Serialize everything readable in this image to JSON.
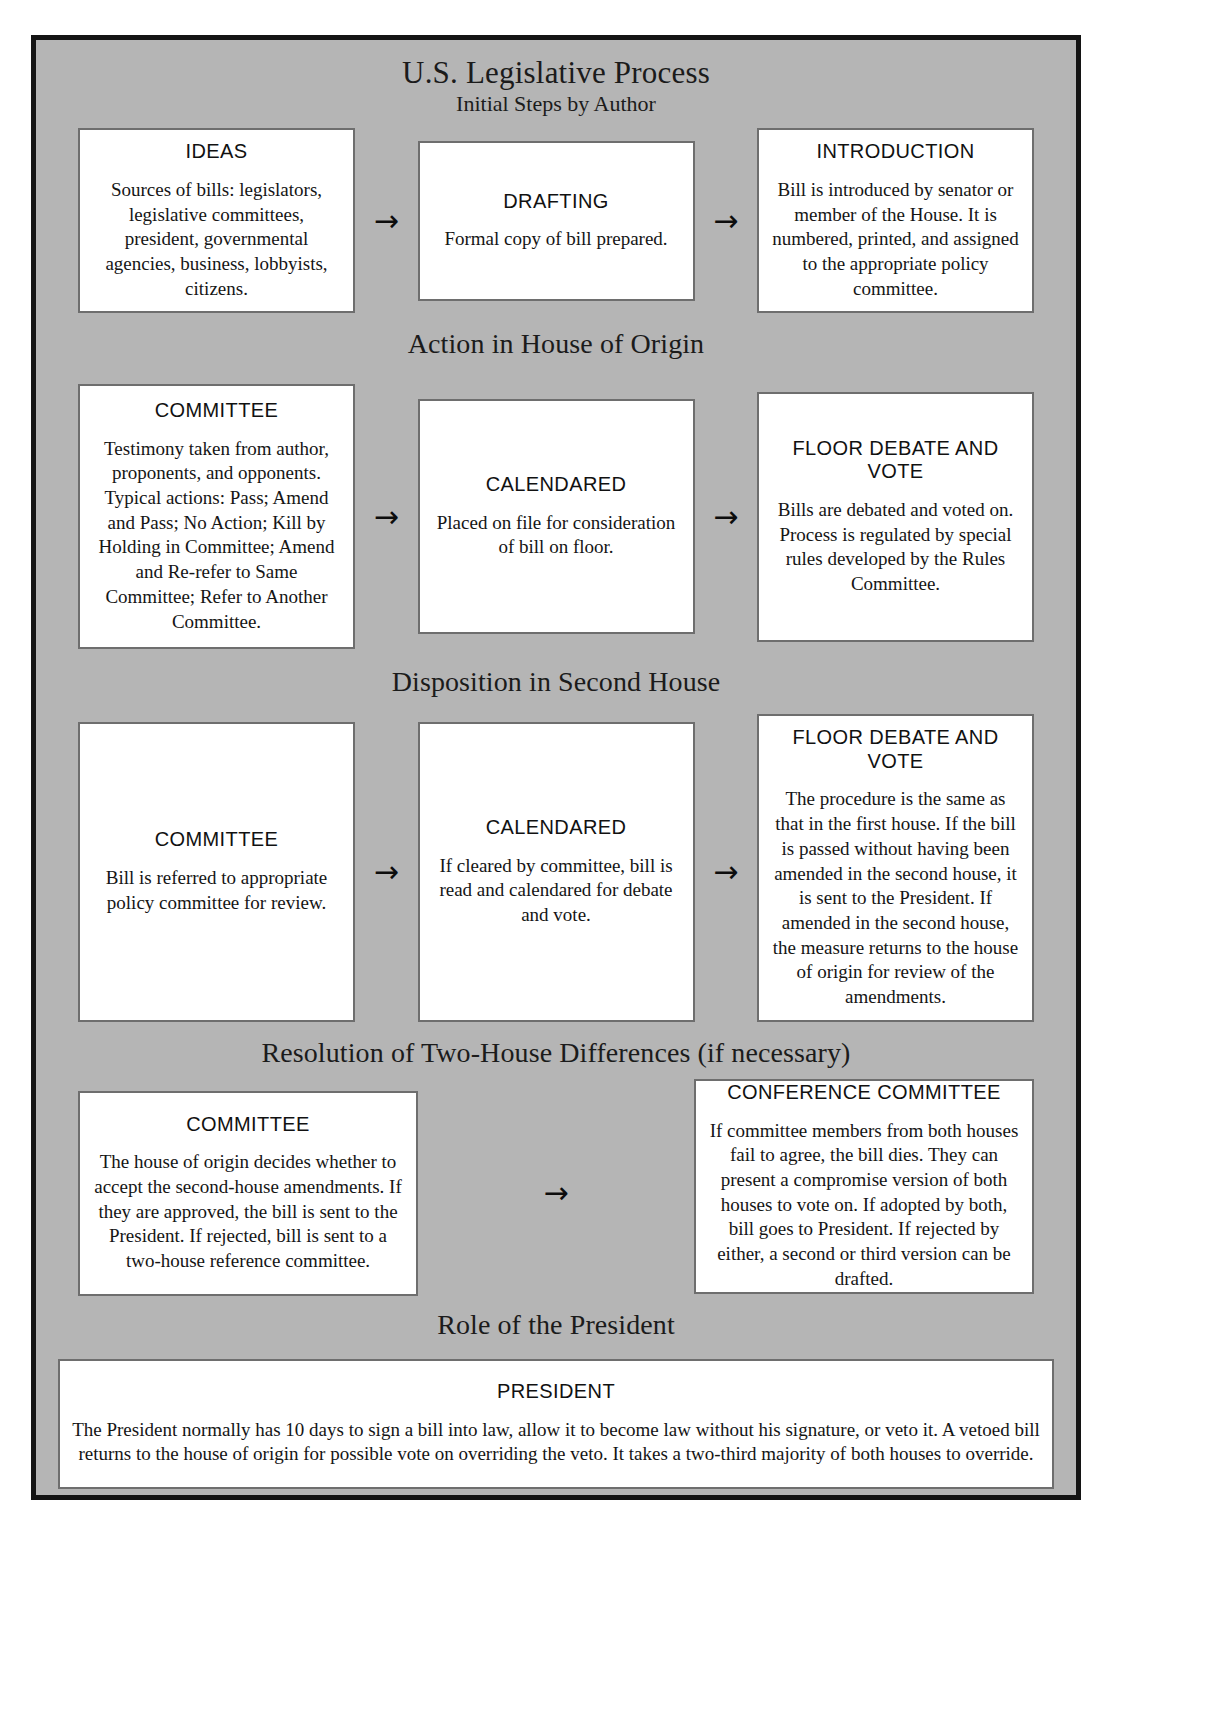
{
  "poster": {
    "title": "U.S. Legislative Process",
    "subtitle": "Initial Steps by Author",
    "arrow_glyph": "→"
  },
  "sections": [
    {
      "heading": "Initial Steps by Author",
      "boxes": [
        {
          "title": "IDEAS",
          "body": "Sources of bills: legislators, legislative committees, president, governmental agencies, business, lobbyists, citizens."
        },
        {
          "title": "DRAFTING",
          "body": "Formal copy of bill prepared."
        },
        {
          "title": "INTRODUCTION",
          "body": "Bill is introduced by senator or member of the House.  It is numbered, printed, and assigned to the appropriate policy committee."
        }
      ]
    },
    {
      "heading": "Action in House of Origin",
      "boxes": [
        {
          "title": "COMMITTEE",
          "body": "Testimony taken from author, proponents, and opponents. Typical actions: Pass; Amend and Pass; No Action; Kill by Holding in Committee; Amend and Re-refer to Same Committee; Refer to Another Committee."
        },
        {
          "title": "CALENDARED",
          "body": "Placed on file for consideration of bill on floor."
        },
        {
          "title": "FLOOR DEBATE AND VOTE",
          "body": "Bills are debated and voted on. Process is regulated by special rules developed by the Rules Committee."
        }
      ]
    },
    {
      "heading": "Disposition in Second House",
      "boxes": [
        {
          "title": "COMMITTEE",
          "body": "Bill is referred to appropriate policy committee for review."
        },
        {
          "title": "CALENDARED",
          "body": "If cleared by committee, bill is read and calendared for debate and vote."
        },
        {
          "title": "FLOOR DEBATE AND VOTE",
          "body": "The procedure is the same as that in the first house.  If the bill is passed without having been amended in the second house, it is sent to the President.  If amended in the second house, the measure returns to the house of origin for review of the amendments."
        }
      ]
    },
    {
      "heading": "Resolution of Two-House Differences (if necessary)",
      "boxes": [
        {
          "title": "COMMITTEE",
          "body": "The house of origin decides whether to accept the second-house amendments.  If they are approved, the bill is sent to the President.  If rejected, bill is sent to a two-house reference committee."
        },
        {
          "title": "CONFERENCE COMMITTEE",
          "body": "If committee members from both houses fail to agree, the bill dies. They can present a compromise version of both houses to vote on.  If adopted by both, bill goes to President. If rejected by either, a second or third version can be drafted."
        }
      ]
    },
    {
      "heading": "Role of the President",
      "boxes": [
        {
          "title": "PRESIDENT",
          "body": "The President normally has 10 days to sign a bill into law, allow it to become law without his signature, or veto it.  A vetoed bill returns to the house of origin for possible vote on overriding the veto. It takes a two-third majority of both houses to override."
        }
      ]
    }
  ],
  "colors": {
    "background": "#b5b5b5",
    "border": "#141414",
    "box_background": "#ffffff",
    "box_border": "#6e6e6e",
    "text": "#151515"
  }
}
